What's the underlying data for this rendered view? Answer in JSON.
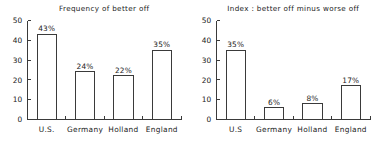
{
  "figure": {
    "width": 377,
    "height": 143,
    "background": "#ffffff",
    "ink_color": "#3a3a3a",
    "text_color": "#222222"
  },
  "chart_data": [
    {
      "type": "bar",
      "id": "frequency-of-better-off",
      "title": "Frequency of better off",
      "xlabel": "",
      "ylabel": "",
      "categories": [
        "U.S.",
        "Germany",
        "Holland",
        "England"
      ],
      "values": [
        43,
        24,
        22,
        35
      ],
      "data_labels": [
        "43%",
        "24%",
        "22%",
        "35%"
      ],
      "yticks": [
        0,
        10,
        20,
        30,
        40,
        50
      ],
      "ytick_labels": [
        "0",
        "10",
        "20",
        "30",
        "40",
        "50"
      ],
      "ylim": [
        0,
        50
      ],
      "grid": false,
      "legend": "none",
      "bar_fill": "#ffffff",
      "bar_edge": "#3a3a3a"
    },
    {
      "type": "bar",
      "id": "index-better-off-minus-worse-off",
      "title": "Index : better off minus worse off",
      "xlabel": "",
      "ylabel": "",
      "categories": [
        "U.S",
        "Germany",
        "Holland",
        "England"
      ],
      "values": [
        35,
        6,
        8,
        17
      ],
      "data_labels": [
        "35%",
        "6%",
        "8%",
        "17%"
      ],
      "yticks": [
        0,
        10,
        20,
        30,
        40,
        50
      ],
      "ytick_labels": [
        "0",
        "10",
        "20",
        "30",
        "40",
        "50"
      ],
      "ylim": [
        0,
        50
      ],
      "grid": false,
      "legend": "none",
      "bar_fill": "#ffffff",
      "bar_edge": "#3a3a3a"
    }
  ]
}
